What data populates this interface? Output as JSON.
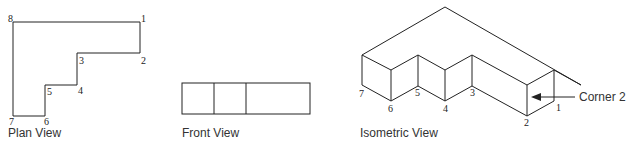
{
  "views": {
    "plan": {
      "caption": "Plan View",
      "points": [
        "1",
        "2",
        "3",
        "4",
        "5",
        "6",
        "7",
        "8"
      ]
    },
    "front": {
      "caption": "Front View"
    },
    "isometric": {
      "caption": "Isometric View",
      "points": [
        "7",
        "6",
        "5",
        "4",
        "3",
        "2",
        "1"
      ],
      "annotation": "Corner 2"
    }
  },
  "colors": {
    "stroke": "#222222",
    "text": "#333333"
  }
}
